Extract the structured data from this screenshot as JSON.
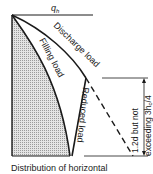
{
  "diagram": {
    "top_label": "q",
    "top_label_sub": "h",
    "curves": {
      "discharge": "Discharge load",
      "filling": "Filling load",
      "reduced": "Reduced load"
    },
    "dimension": {
      "line1": "1.2d but not",
      "line2": "exceeding 3h",
      "line2_sub": "c",
      "line2_tail": "/4"
    },
    "caption": "Distribution of horizontal"
  },
  "colors": {
    "ink": "#1a1a1a",
    "hatch": "#bdbdbd"
  }
}
